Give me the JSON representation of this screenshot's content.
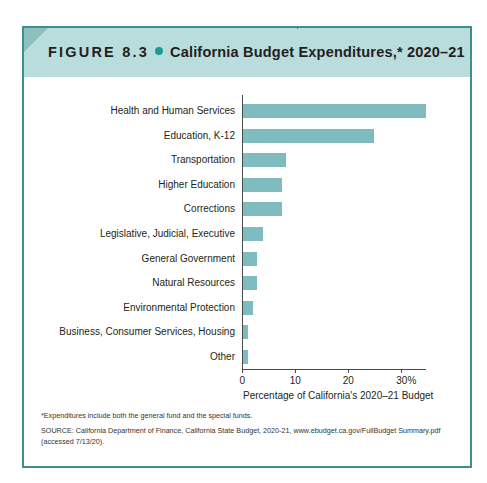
{
  "figure": {
    "label": "FIGURE 8.3",
    "title": "California Budget Expenditures,* 2020–21",
    "footnote": "*Expenditures include both the general fund and the special funds.",
    "source": "SOURCE: California Department of Finance, California State Budget, 2020-21, www.ebudget.ca.gov/FullBudget Summary.pdf (accessed 7/13/20)."
  },
  "colors": {
    "frame": "#3f8f8c",
    "header_bg": "#b9dcdc",
    "bullet": "#1e9a93",
    "bar": "#7fbcc0"
  },
  "chart_data": {
    "type": "bar",
    "orientation": "horizontal",
    "title": "California Budget Expenditures,* 2020–21",
    "xlabel": "Percentage of California's 2020–21 Budget",
    "ylabel": "",
    "categories": [
      "Health and Human Services",
      "Education, K-12",
      "Transportation",
      "Higher Education",
      "Corrections",
      "Legislative, Judicial, Executive",
      "General Government",
      "Natural Resources",
      "Environmental Protection",
      "Business, Consumer Services, Housing",
      "Other"
    ],
    "values": [
      34.6,
      24.7,
      8.1,
      7.3,
      7.3,
      3.7,
      2.7,
      2.7,
      1.9,
      0.9,
      0.9
    ],
    "xlim": [
      0,
      34.6
    ],
    "x_ticks": [
      "0",
      "10",
      "20",
      "30%"
    ],
    "x_tick_values": [
      0,
      10,
      20,
      30
    ],
    "grid": false,
    "legend": null
  }
}
